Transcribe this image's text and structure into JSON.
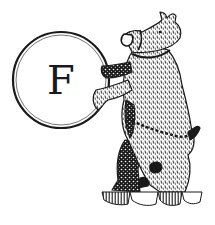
{
  "logo": {
    "letter": "F",
    "emblem": "bear-holding-roundel",
    "colors": {
      "ink": "#1a1a1a",
      "background": "#ffffff"
    }
  }
}
